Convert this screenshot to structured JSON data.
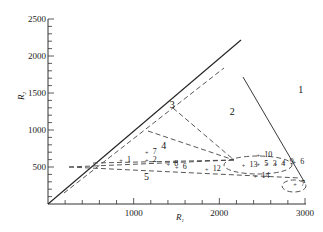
{
  "chart_data": {
    "type": "scatter",
    "title": "",
    "xlabel": "R1",
    "ylabel": "R2",
    "xlim": [
      0,
      3000
    ],
    "ylim": [
      0,
      2500
    ],
    "x_ticks": [
      "1000",
      "2000",
      "3000"
    ],
    "y_ticks": [
      "500",
      "1000",
      "1500",
      "2000",
      "2500"
    ],
    "grid": false,
    "regions": [
      {
        "label": "1",
        "x": 2950,
        "y": 1500
      },
      {
        "label": "2",
        "x": 2150,
        "y": 1200
      },
      {
        "label": "3",
        "x": 1450,
        "y": 1300
      },
      {
        "label": "4",
        "x": 1350,
        "y": 750
      },
      {
        "label": "5",
        "x": 1150,
        "y": 320
      }
    ],
    "points": [
      {
        "label": "1",
        "x": 900,
        "y": 610
      },
      {
        "label": "2",
        "x": 1200,
        "y": 610
      },
      {
        "label": "7",
        "x": 1200,
        "y": 720
      },
      {
        "label": "8",
        "x": 1450,
        "y": 560
      },
      {
        "label": "6",
        "x": 1550,
        "y": 510
      },
      {
        "label": "12",
        "x": 1900,
        "y": 480
      },
      {
        "label": "13",
        "x": 2330,
        "y": 540
      },
      {
        "label": "10",
        "x": 2500,
        "y": 680
      },
      {
        "label": "5",
        "x": 2500,
        "y": 560
      },
      {
        "label": "3",
        "x": 2600,
        "y": 560
      },
      {
        "label": "4",
        "x": 2700,
        "y": 560
      },
      {
        "label": "9",
        "x": 2800,
        "y": 580
      },
      {
        "label": "6",
        "x": 2920,
        "y": 580
      },
      {
        "label": "14",
        "x": 2470,
        "y": 390
      },
      {
        "label": "7",
        "x": 2930,
        "y": 280
      }
    ]
  },
  "axes": {
    "x_label": "R",
    "x_sub": "1",
    "y_label": "R",
    "y_sub": "2"
  }
}
